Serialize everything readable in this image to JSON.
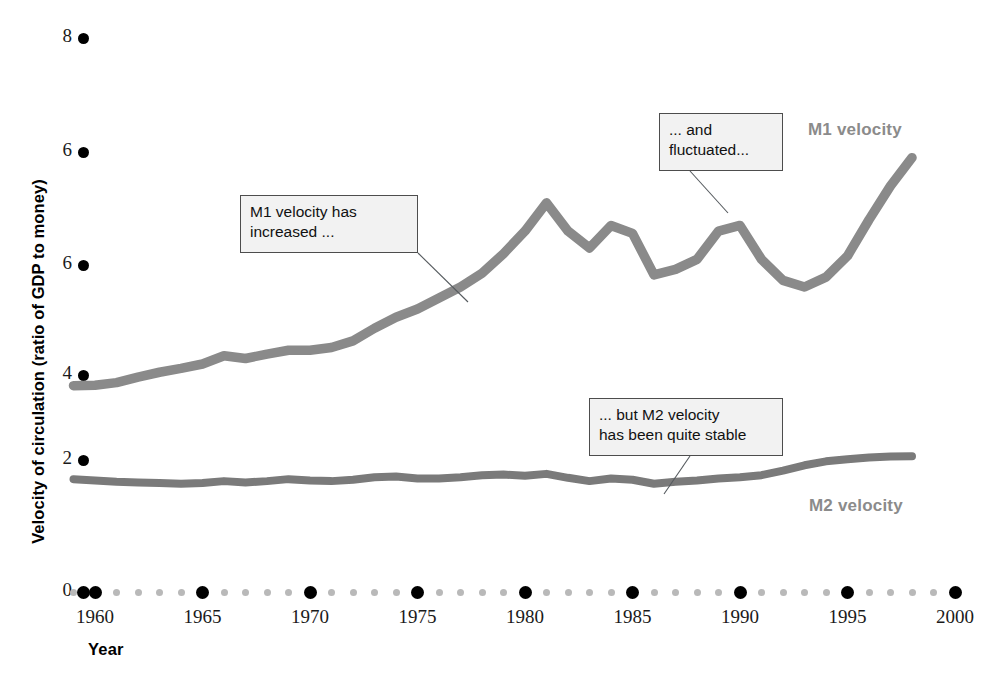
{
  "chart_data": {
    "type": "line",
    "title": "",
    "xlabel": "Year",
    "ylabel": "Velocity of circulation (ratio of GDP to money)",
    "xlim": [
      1959,
      2000
    ],
    "ylim": [
      0,
      8
    ],
    "grid": false,
    "legend_position": "inline-right",
    "x_ticks": [
      "1960",
      "1965",
      "1970",
      "1975",
      "1980",
      "1985",
      "1990",
      "1995",
      "2000"
    ],
    "x_tick_values": [
      1960,
      1965,
      1970,
      1975,
      1980,
      1985,
      1990,
      1995,
      2000
    ],
    "y_ticks": [
      "8",
      "6",
      "6",
      "4",
      "2",
      "0"
    ],
    "y_tick_values": [
      8,
      7,
      6,
      4,
      2,
      0
    ],
    "x": [
      1959,
      1960,
      1961,
      1962,
      1963,
      1964,
      1965,
      1966,
      1967,
      1968,
      1969,
      1970,
      1971,
      1972,
      1973,
      1974,
      1975,
      1976,
      1977,
      1978,
      1979,
      1980,
      1981,
      1982,
      1983,
      1984,
      1985,
      1986,
      1987,
      1988,
      1989,
      1990,
      1991,
      1992,
      1993,
      1994,
      1995,
      1996,
      1997,
      1998
    ],
    "series": [
      {
        "name": "M1 velocity",
        "color": "#8a8a8a",
        "values": [
          3.75,
          3.76,
          3.82,
          3.95,
          4.05,
          4.12,
          4.2,
          4.35,
          4.3,
          4.38,
          4.45,
          4.45,
          4.5,
          4.62,
          4.85,
          5.05,
          5.2,
          5.4,
          5.6,
          5.85,
          6.1,
          6.3,
          6.55,
          6.3,
          6.15,
          6.35,
          6.28,
          5.82,
          5.92,
          6.05,
          6.3,
          6.35,
          6.05,
          5.72,
          5.6,
          5.78,
          6.08,
          6.4,
          6.7,
          6.95
        ]
      },
      {
        "name": "M2 velocity",
        "color": "#7a7a7a",
        "values": [
          1.71,
          1.69,
          1.67,
          1.66,
          1.65,
          1.64,
          1.65,
          1.68,
          1.66,
          1.68,
          1.71,
          1.69,
          1.68,
          1.7,
          1.74,
          1.75,
          1.72,
          1.72,
          1.74,
          1.77,
          1.78,
          1.76,
          1.79,
          1.73,
          1.68,
          1.72,
          1.7,
          1.64,
          1.67,
          1.69,
          1.72,
          1.74,
          1.77,
          1.84,
          1.92,
          1.98,
          2.02,
          2.06,
          2.08,
          2.09
        ]
      }
    ],
    "annotations": [
      {
        "id": "m1-increase",
        "text": "M1 velocity has\nincreased ...",
        "box": {
          "x": 240,
          "y": 195,
          "width": 178,
          "height": 58
        },
        "leader": {
          "x1": 418,
          "y1": 253,
          "x2": 468,
          "y2": 302
        }
      },
      {
        "id": "m1-fluctuated",
        "text": "... and\nfluctuated...",
        "box": {
          "x": 659,
          "y": 113,
          "width": 124,
          "height": 58
        },
        "leader": {
          "x1": 690,
          "y1": 171,
          "x2": 728,
          "y2": 213
        }
      },
      {
        "id": "m2-stable",
        "text": "... but M2 velocity\nhas been quite stable",
        "box": {
          "x": 589,
          "y": 398,
          "width": 194,
          "height": 58
        },
        "leader": {
          "x1": 690,
          "y1": 456,
          "x2": 664,
          "y2": 494
        }
      }
    ],
    "series_labels": [
      {
        "name": "M1 velocity",
        "x": 808,
        "y": 120
      },
      {
        "name": "M2 velocity",
        "x": 809,
        "y": 496
      }
    ]
  },
  "axis": {
    "y_title": "Velocity of circulation (ratio of GDP to money)",
    "x_title": "Year"
  },
  "source_note": ""
}
